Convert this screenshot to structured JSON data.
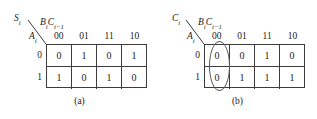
{
  "figures": [
    {
      "id": "a",
      "caption": "(a)",
      "output_label": {
        "base": "S",
        "sub": "i"
      },
      "column_var_label": [
        {
          "base": "B",
          "sub": "i"
        },
        {
          "base": "C",
          "sub": "i−1"
        }
      ],
      "row_var_label": {
        "base": "A",
        "sub": "i"
      },
      "column_headers": [
        "00",
        "01",
        "11",
        "10"
      ],
      "row_headers": [
        "0",
        "1"
      ],
      "cells": [
        [
          "0",
          "1",
          "0",
          "1"
        ],
        [
          "1",
          "0",
          "1",
          "0"
        ]
      ],
      "circled": [
        [
          false,
          true,
          false,
          true
        ],
        [
          true,
          false,
          true,
          false
        ]
      ],
      "column_group": null
    },
    {
      "id": "b",
      "caption": "(b)",
      "output_label": {
        "base": "C",
        "sub": "i"
      },
      "column_var_label": [
        {
          "base": "B",
          "sub": "i"
        },
        {
          "base": "C",
          "sub": "i−1"
        }
      ],
      "row_var_label": {
        "base": "A",
        "sub": "i"
      },
      "column_headers": [
        "00",
        "01",
        "11",
        "10"
      ],
      "row_headers": [
        "0",
        "1"
      ],
      "cells": [
        [
          "0",
          "0",
          "1",
          "0"
        ],
        [
          "0",
          "1",
          "1",
          "1"
        ]
      ],
      "circled": [
        [
          false,
          false,
          false,
          false
        ],
        [
          false,
          true,
          false,
          true
        ]
      ],
      "column_group": {
        "column_index": 2,
        "spans_rows": [
          0,
          1
        ]
      }
    }
  ],
  "colors": {
    "grid_line": "#3c3c3c",
    "oval_line": "#5a5a5a",
    "text": "#1a1a1a",
    "background": "#ffffff"
  }
}
